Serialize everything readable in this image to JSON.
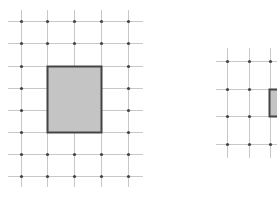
{
  "colors": {
    "background": "#ffffff",
    "grid_line": "#c8c8c8",
    "grid_dot": "#444444",
    "rect_fill": "#c4c4c4",
    "rect_stroke": "#444444"
  },
  "figures": [
    {
      "name": "left-grid",
      "x_lines": [
        21,
        47,
        74,
        101,
        128
      ],
      "y_lines": [
        21,
        43,
        66,
        88,
        110,
        132,
        154,
        176
      ],
      "h_extent": [
        8,
        143
      ],
      "v_extent": [
        10,
        187
      ],
      "rect": {
        "x": 47,
        "y": 66,
        "w": 54,
        "h": 66
      }
    },
    {
      "name": "right-grid",
      "x_lines": [
        227,
        249,
        270
      ],
      "y_lines": [
        61,
        89,
        116,
        144
      ],
      "h_extent": [
        216,
        277
      ],
      "v_extent": [
        48,
        158
      ],
      "rect": {
        "x": 269,
        "y": 89,
        "w": 20,
        "h": 27
      }
    }
  ]
}
